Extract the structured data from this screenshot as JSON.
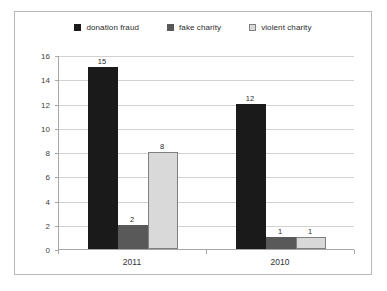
{
  "chart_data": {
    "type": "bar",
    "title": "",
    "subtitle": "",
    "xlabel": "",
    "ylabel": "",
    "categories": [
      "2011",
      "2010"
    ],
    "series": [
      {
        "name": "donation fraud",
        "color": "#1a1a1a",
        "border": "#1a1a1a",
        "values": [
          15,
          12
        ]
      },
      {
        "name": "fake charity",
        "color": "#595959",
        "border": "#595959",
        "values": [
          2,
          1
        ]
      },
      {
        "name": "violent charity",
        "color": "#d9d9d9",
        "border": "#808080",
        "values": [
          8,
          1
        ]
      }
    ],
    "ylim": [
      0,
      16
    ],
    "ytick_step": 2,
    "yticks": [
      "0",
      "2",
      "4",
      "6",
      "8",
      "10",
      "12",
      "14",
      "16"
    ],
    "grid": true,
    "legend_position": "top",
    "value_labels": true
  },
  "legend": {
    "items": [
      {
        "label": "donation fraud"
      },
      {
        "label": "fake charity"
      },
      {
        "label": "violent charity"
      }
    ]
  }
}
